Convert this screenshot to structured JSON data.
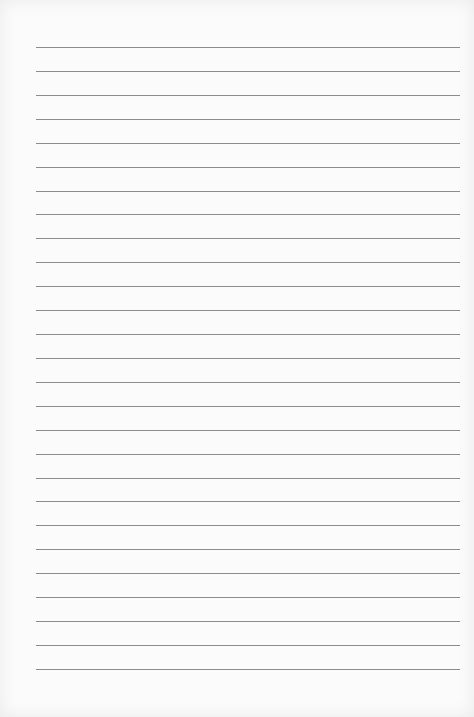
{
  "document": {
    "type": "lined-paper",
    "line_count": 27,
    "first_line_y": 47,
    "line_spacing": 23.92,
    "line_left": 36,
    "line_right": 460,
    "colors": {
      "paper": "#fbfbfb",
      "rule": "#8c8c8c"
    }
  }
}
